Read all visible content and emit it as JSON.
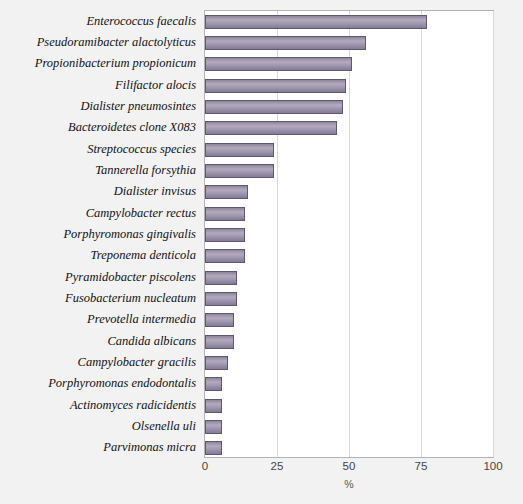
{
  "chart_data": {
    "type": "bar",
    "orientation": "horizontal",
    "title": "",
    "xlabel": "%",
    "ylabel": "",
    "xlim": [
      0,
      100
    ],
    "xticks": [
      0,
      25,
      50,
      75,
      100
    ],
    "grid": true,
    "legend": false,
    "bar_color": "#a79eb5",
    "bar_border_color": "#5f5870",
    "plot_background": "#ffffff",
    "page_background": "#f2f2f2",
    "categories": [
      "Enterococcus faecalis",
      "Pseudoramibacter alactolyticus",
      "Propionibacterium propionicum",
      "Filifactor alocis",
      "Dialister pneumosintes",
      "Bacteroidetes clone X083",
      "Streptococcus species",
      "Tannerella forsythia",
      "Dialister invisus",
      "Campylobacter rectus",
      "Porphyromonas gingivalis",
      "Treponema denticola",
      "Pyramidobacter piscolens",
      "Fusobacterium nucleatum",
      "Prevotella intermedia",
      "Candida albicans",
      "Campylobacter gracilis",
      "Porphyromonas endodontalis",
      "Actinomyces radicidentis",
      "Olsenella uli",
      "Parvimonas micra"
    ],
    "values": [
      77,
      56,
      51,
      49,
      48,
      46,
      24,
      24,
      15,
      14,
      14,
      14,
      11,
      11,
      10,
      10,
      8,
      6,
      6,
      6,
      6
    ]
  }
}
